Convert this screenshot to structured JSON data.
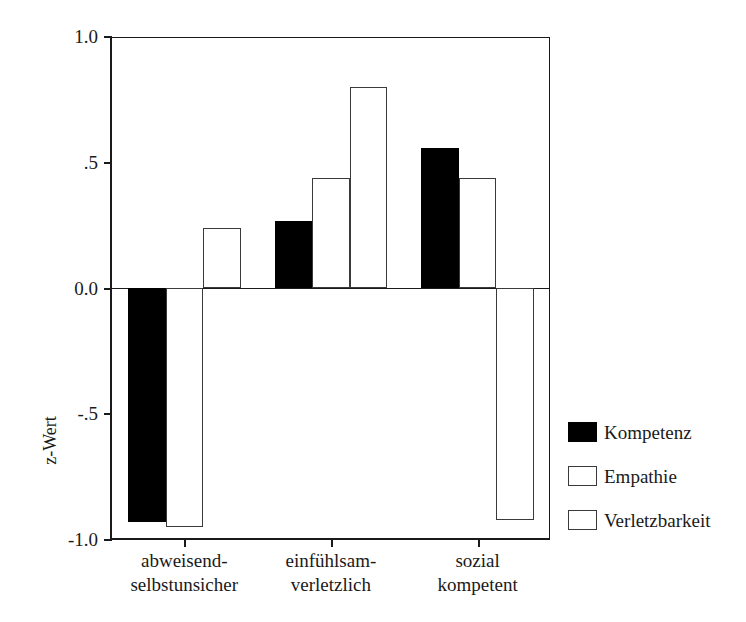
{
  "chart_data": {
    "type": "bar",
    "title": "",
    "subtitle": "",
    "xlabel": "",
    "ylabel": "z-Wert",
    "ylim": [
      -1.0,
      1.0
    ],
    "ytick_labels": [
      "1.0",
      ".5",
      "0.0",
      "-.5",
      "-1.0"
    ],
    "ytick_values": [
      1.0,
      0.5,
      0.0,
      -0.5,
      -1.0
    ],
    "grid": false,
    "legend_position": "right",
    "categories": [
      "abweisend-\nselbstunsicher",
      "einfühlsam-\nverletzlich",
      "sozial\nkompetent"
    ],
    "category_lines": [
      [
        "abweisend-",
        "selbstunsicher"
      ],
      [
        "einfühlsam-",
        "verletzlich"
      ],
      [
        "sozial",
        "kompetent"
      ]
    ],
    "series": [
      {
        "name": "Kompetenz",
        "fill": "#000000",
        "values": [
          -0.93,
          0.27,
          0.56
        ]
      },
      {
        "name": "Empathie",
        "fill": "#ffffff",
        "values": [
          -0.95,
          0.44,
          0.44
        ]
      },
      {
        "name": "Verletzbarkeit",
        "fill": "#ffffff",
        "values": [
          0.24,
          0.8,
          -0.92
        ]
      }
    ]
  },
  "axis": {
    "y_title": "z-Wert",
    "y_ticks": [
      {
        "label": "1.0",
        "value": 1.0
      },
      {
        "label": ".5",
        "value": 0.5
      },
      {
        "label": "0.0",
        "value": 0.0
      },
      {
        "label": "-.5",
        "value": -0.5
      },
      {
        "label": "-1.0",
        "value": -1.0
      }
    ]
  },
  "legend": {
    "items": [
      {
        "label": "Kompetenz",
        "style": "filled"
      },
      {
        "label": "Empathie",
        "style": "hollow"
      },
      {
        "label": "Verletzbarkeit",
        "style": "hollow"
      }
    ]
  }
}
